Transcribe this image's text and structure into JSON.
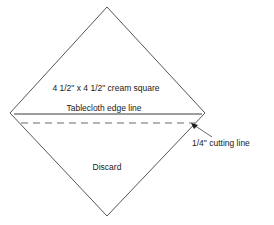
{
  "figure": {
    "title_visible": false,
    "background_color": "#ffffff",
    "outline_color": "#555555",
    "line_color": "#3a3a3a",
    "text_color": "#1a1a1a",
    "diamond": {
      "shape": "rotated-square",
      "top": [
        107,
        7
      ],
      "right": [
        205,
        113
      ],
      "bottom": [
        107,
        216
      ],
      "left": [
        10,
        113
      ]
    },
    "edge_line": {
      "style": "solid",
      "from": [
        14,
        114
      ],
      "to": [
        202,
        114
      ]
    },
    "cutting_line": {
      "style": "dashed",
      "from": [
        21,
        123
      ],
      "to": [
        195,
        123
      ],
      "dash_pattern": "7 5"
    },
    "leader": {
      "arrow_tip": [
        192,
        124
      ],
      "from": [
        212,
        137
      ]
    }
  },
  "labels": {
    "cream_square": "4 1/2\" x 4 1/2\" cream square",
    "edge_line": "Tablecloth edge line",
    "discard": "Discard",
    "cutting_line": "1/4\" cutting line"
  }
}
